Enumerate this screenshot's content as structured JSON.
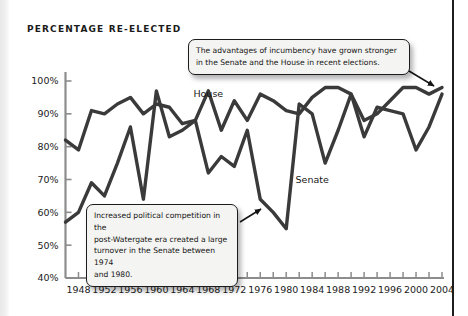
{
  "figure": {
    "title": "PERCENTAGE RE-ELECTED",
    "colors": {
      "line": "#3a3a3a",
      "axis": "#8c8c8c",
      "text": "#1b1b1b",
      "callout_fill": "#f4f4f2",
      "callout_border": "#1c1c1c",
      "page_border": "#1d1d1d"
    }
  },
  "annotations": {
    "top": {
      "line1": "The advantages of incumbency have grown stronger",
      "line2": "in the Senate and the House in recent elections."
    },
    "bottom": {
      "line1": "Increased political competition in the",
      "line2": "post-Watergate era created a large",
      "line3": "turnover in the Senate between 1974",
      "line4": "and 1980."
    }
  },
  "chart_data": {
    "type": "line",
    "title": "PERCENTAGE RE-ELECTED",
    "xlabel": "",
    "ylabel": "",
    "xlim": [
      1946,
      2004
    ],
    "ylim": [
      40,
      100
    ],
    "ytick_labels": [
      "100%",
      "90%",
      "80%",
      "70%",
      "60%",
      "50%",
      "40%"
    ],
    "ytick_values": [
      100,
      90,
      80,
      70,
      60,
      50,
      40
    ],
    "xtick_labels": [
      "1948",
      "1952",
      "1956",
      "1960",
      "1964",
      "1968",
      "1972",
      "1976",
      "1980",
      "1984",
      "1988",
      "1992",
      "1996",
      "2000",
      "2004"
    ],
    "xtick_values": [
      1948,
      1952,
      1956,
      1960,
      1964,
      1968,
      1972,
      1976,
      1980,
      1984,
      1988,
      1992,
      1996,
      2000,
      2004
    ],
    "minor_tick_interval": 2,
    "grid": false,
    "legend": "inline-labels",
    "x": [
      1946,
      1948,
      1950,
      1952,
      1954,
      1956,
      1958,
      1960,
      1962,
      1964,
      1966,
      1968,
      1970,
      1972,
      1974,
      1976,
      1978,
      1980,
      1982,
      1984,
      1986,
      1988,
      1990,
      1992,
      1994,
      1996,
      1998,
      2000,
      2002,
      2004
    ],
    "series": [
      {
        "name": "House",
        "label_position": {
          "x": 1968,
          "y": 95
        },
        "values": [
          82,
          79,
          91,
          90,
          93,
          95,
          90,
          93,
          92,
          87,
          88,
          97,
          85,
          94,
          88,
          96,
          94,
          91,
          90,
          95,
          98,
          98,
          96,
          88,
          90,
          94,
          98,
          98,
          96,
          98
        ]
      },
      {
        "name": "Senate",
        "label_position": {
          "x": 1984,
          "y": 69
        },
        "values": [
          57,
          60,
          69,
          65,
          75,
          86,
          64,
          97,
          83,
          85,
          88,
          72,
          77,
          74,
          85,
          64,
          60,
          55,
          93,
          90,
          75,
          85,
          96,
          83,
          92,
          91,
          90,
          79,
          86,
          96
        ]
      }
    ]
  }
}
